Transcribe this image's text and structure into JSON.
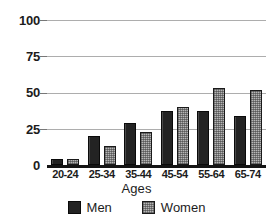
{
  "chart_data": {
    "type": "bar",
    "title": "",
    "subtitle": "",
    "xlabel": "Ages",
    "ylabel": "",
    "categories": [
      "20-24",
      "25-34",
      "35-44",
      "45-54",
      "55-64",
      "65-74"
    ],
    "series": [
      {
        "name": "Men",
        "color": "#232323",
        "values": [
          4,
          20,
          29,
          37,
          37,
          34
        ]
      },
      {
        "name": "Women",
        "color": "#b6b6b6",
        "values": [
          4,
          13,
          23,
          40,
          53,
          52
        ]
      }
    ],
    "ylim": [
      0,
      100
    ],
    "yticks": [
      0,
      25,
      50,
      75,
      100
    ],
    "ytick_labels": [
      "0",
      "25",
      "50",
      "75",
      "100"
    ],
    "grid": true,
    "grid_axis": "y",
    "legend_position": "bottom",
    "bar_group_mode": "grouped"
  },
  "axis": {
    "y_tick_labels": [
      "100",
      "75",
      "50",
      "25",
      "0"
    ],
    "x_title": "Ages"
  },
  "legend": {
    "entries": [
      {
        "label": "Men",
        "swatch": "dark-solid-swatch"
      },
      {
        "label": "Women",
        "swatch": "light-dithered-swatch"
      }
    ]
  },
  "colors": {
    "men_fill": "#232323",
    "women_fill": "#b6b6b6",
    "gridline": "#adadad",
    "axis_line": "#151515",
    "text": "#1c1c1c",
    "background": "#ffffff"
  }
}
